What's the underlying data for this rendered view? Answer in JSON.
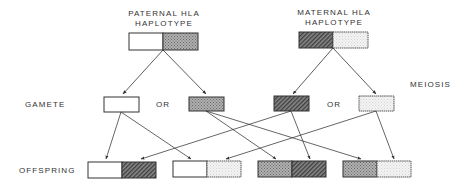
{
  "labels": {
    "paternal_line1": "PATERNAL HLA",
    "paternal_line2": "HAPLOTYPE",
    "maternal_line1": "MATERNAL HLA",
    "maternal_line2": "HAPLOTYPE",
    "meiosis": "MEIOSIS",
    "gamete": "GAMETE",
    "offspring": "OFFSPRING",
    "or_paternal": "OR",
    "or_maternal": "OR"
  },
  "parents": {
    "paternal": {
      "left": "white",
      "right": "crosshatch"
    },
    "maternal": {
      "left": "diagonal-hatch",
      "right": "light-dotted"
    }
  },
  "gametes": [
    {
      "parent": "paternal",
      "pattern": "white"
    },
    {
      "parent": "paternal",
      "pattern": "crosshatch"
    },
    {
      "parent": "maternal",
      "pattern": "diagonal-hatch"
    },
    {
      "parent": "maternal",
      "pattern": "light-dotted"
    }
  ],
  "offspring": [
    {
      "left": "white",
      "right": "diagonal-hatch"
    },
    {
      "left": "white",
      "right": "light-dotted"
    },
    {
      "left": "crosshatch",
      "right": "diagonal-hatch"
    },
    {
      "left": "crosshatch",
      "right": "light-dotted"
    }
  ],
  "colors": {
    "line": "#333333",
    "crosshatch": "#9a9a9a",
    "diagonal_hatch": "#555555",
    "light_dotted": "#e6e6e6"
  }
}
